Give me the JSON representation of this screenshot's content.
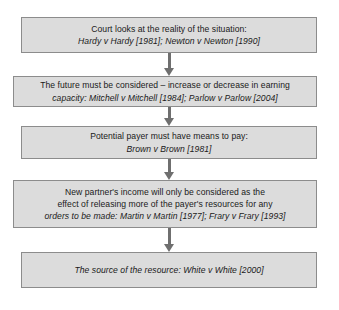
{
  "diagram": {
    "type": "vertical-flowchart",
    "background_color": "#ffffff",
    "node_fill_color": "#dcdcdc",
    "node_border_color": "#8c8c8c",
    "connector_color": "#6f6f6f",
    "text_color": "#1a1a1a",
    "nodes": [
      {
        "id": "node-1",
        "text": "Court looks at the reality of the situation:\nHardy v Hardy [1981]; Newton v Newton [1990]",
        "line_1": "Court looks at the reality of the situation:",
        "line_2": "Hardy v Hardy [1981]; Newton v Newton [1990]",
        "cases": [
          {
            "name": "Hardy v Hardy",
            "year": "[1981]"
          },
          {
            "name": "Newton v Newton",
            "year": "[1990]"
          }
        ]
      },
      {
        "id": "node-2",
        "text": "The future must be considered – increase or decrease in earning\ncapacity: Mitchell v Mitchell [1984]; Parlow v Parlow [2004]",
        "line_1": "The future must be considered – increase or decrease in earning",
        "line_2": "capacity: Mitchell v Mitchell [1984]; Parlow v Parlow [2004]",
        "cases": [
          {
            "name": "Mitchell v Mitchell",
            "year": "[1984]"
          },
          {
            "name": "Parlow v Parlow",
            "year": "[2004]"
          }
        ]
      },
      {
        "id": "node-3",
        "text": "Potential payer must have means to pay:\nBrown v Brown [1981]",
        "line_1": "Potential payer must have means to pay:",
        "line_2": "Brown v Brown [1981]",
        "cases": [
          {
            "name": "Brown v Brown",
            "year": "[1981]"
          }
        ]
      },
      {
        "id": "node-4",
        "text": "New partner's income will only be considered as the\neffect of releasing more of the payer's resources for any\norders to be made: Martin v Martin [1977]; Frary v Frary [1993]",
        "line_1": "New partner's income will only be considered as the",
        "line_2": "effect of releasing more of the payer's resources for any",
        "line_3": "orders to be made: Martin v Martin [1977]; Frary v Frary [1993]",
        "cases": [
          {
            "name": "Martin v Martin",
            "year": "[1977]"
          },
          {
            "name": "Frary v Frary",
            "year": "[1993]"
          }
        ]
      },
      {
        "id": "node-5",
        "text": "The source of the resource: White v White [2000]",
        "line_1": "The source of the resource: White v White [2000]",
        "cases": [
          {
            "name": "White v White",
            "year": "[2000]"
          }
        ]
      }
    ],
    "connectors": [
      {
        "id": "conn-1",
        "from": "node-1",
        "to": "node-2",
        "direction": "down"
      },
      {
        "id": "conn-2",
        "from": "node-2",
        "to": "node-3",
        "direction": "down"
      },
      {
        "id": "conn-3",
        "from": "node-3",
        "to": "node-4",
        "direction": "down"
      },
      {
        "id": "conn-4",
        "from": "node-4",
        "to": "node-5",
        "direction": "down"
      }
    ]
  }
}
